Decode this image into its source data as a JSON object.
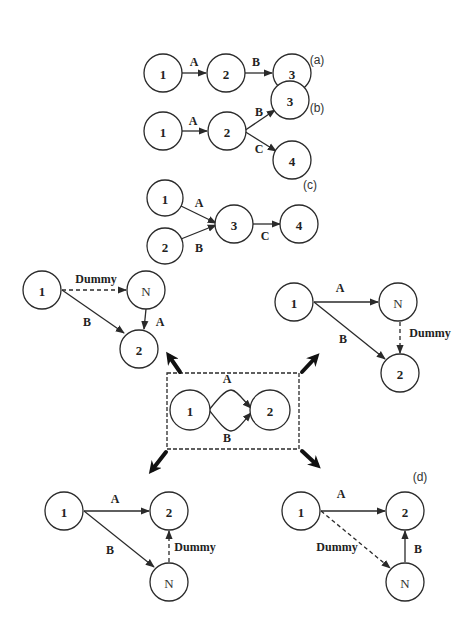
{
  "diagram": {
    "type": "activity-on-arrow network diagrams",
    "panels": [
      {
        "id": "a",
        "label": "(a)",
        "nodes": [
          {
            "id": "1",
            "label": "1",
            "x": 163,
            "y": 73
          },
          {
            "id": "2",
            "label": "2",
            "x": 226,
            "y": 73
          },
          {
            "id": "3",
            "label": "3",
            "x": 292,
            "y": 73
          }
        ],
        "edges": [
          {
            "from": "1",
            "to": "2",
            "label": "A",
            "style": "solid"
          },
          {
            "from": "2",
            "to": "3",
            "label": "B",
            "style": "solid"
          }
        ]
      },
      {
        "id": "b",
        "label": "(b)",
        "nodes": [
          {
            "id": "1",
            "label": "1",
            "x": 163,
            "y": 131
          },
          {
            "id": "2",
            "label": "2",
            "x": 227,
            "y": 131
          },
          {
            "id": "3",
            "label": "3",
            "x": 290,
            "y": 100
          },
          {
            "id": "4",
            "label": "4",
            "x": 292,
            "y": 160
          }
        ],
        "edges": [
          {
            "from": "1",
            "to": "2",
            "label": "A",
            "style": "solid"
          },
          {
            "from": "2",
            "to": "3",
            "label": "B",
            "style": "solid"
          },
          {
            "from": "2",
            "to": "4",
            "label": "C",
            "style": "solid"
          }
        ]
      },
      {
        "id": "c",
        "label": "(c)",
        "nodes": [
          {
            "id": "1",
            "label": "1",
            "x": 165,
            "y": 198
          },
          {
            "id": "2",
            "label": "2",
            "x": 165,
            "y": 246
          },
          {
            "id": "3",
            "label": "3",
            "x": 234,
            "y": 224
          },
          {
            "id": "4",
            "label": "4",
            "x": 299,
            "y": 224
          }
        ],
        "edges": [
          {
            "from": "1",
            "to": "3",
            "label": "A",
            "style": "solid"
          },
          {
            "from": "2",
            "to": "3",
            "label": "B",
            "style": "solid"
          },
          {
            "from": "3",
            "to": "4",
            "label": "C",
            "style": "solid"
          }
        ]
      },
      {
        "id": "d",
        "label": "(d)",
        "center": {
          "nodes": [
            {
              "id": "1",
              "label": "1",
              "x": 190,
              "y": 410
            },
            {
              "id": "2",
              "label": "2",
              "x": 270,
              "y": 410
            }
          ],
          "edges": [
            {
              "from": "1",
              "to": "2",
              "label": "A",
              "style": "curved-top"
            },
            {
              "from": "1",
              "to": "2",
              "label": "B",
              "style": "curved-bottom"
            }
          ]
        },
        "variants": [
          {
            "position": "top-left",
            "nodes": [
              {
                "id": "1",
                "label": "1"
              },
              {
                "id": "N",
                "label": "N"
              },
              {
                "id": "2",
                "label": "2"
              }
            ],
            "edges": [
              {
                "from": "1",
                "to": "N",
                "label": "Dummy",
                "style": "dashed"
              },
              {
                "from": "N",
                "to": "2",
                "label": "A",
                "style": "solid"
              },
              {
                "from": "1",
                "to": "2",
                "label": "B",
                "style": "solid"
              }
            ]
          },
          {
            "position": "top-right",
            "nodes": [
              {
                "id": "1",
                "label": "1"
              },
              {
                "id": "N",
                "label": "N"
              },
              {
                "id": "2",
                "label": "2"
              }
            ],
            "edges": [
              {
                "from": "1",
                "to": "N",
                "label": "A",
                "style": "solid"
              },
              {
                "from": "N",
                "to": "2",
                "label": "Dummy",
                "style": "dashed"
              },
              {
                "from": "1",
                "to": "2",
                "label": "B",
                "style": "solid"
              }
            ]
          },
          {
            "position": "bottom-left",
            "nodes": [
              {
                "id": "1",
                "label": "1"
              },
              {
                "id": "2",
                "label": "2"
              },
              {
                "id": "N",
                "label": "N"
              }
            ],
            "edges": [
              {
                "from": "1",
                "to": "2",
                "label": "A",
                "style": "solid"
              },
              {
                "from": "1",
                "to": "N",
                "label": "B",
                "style": "solid"
              },
              {
                "from": "N",
                "to": "2",
                "label": "Dummy",
                "style": "dashed"
              }
            ]
          },
          {
            "position": "bottom-right",
            "nodes": [
              {
                "id": "1",
                "label": "1"
              },
              {
                "id": "2",
                "label": "2"
              },
              {
                "id": "N",
                "label": "N"
              }
            ],
            "edges": [
              {
                "from": "1",
                "to": "2",
                "label": "A",
                "style": "solid"
              },
              {
                "from": "1",
                "to": "N",
                "label": "Dummy",
                "style": "dashed"
              },
              {
                "from": "N",
                "to": "2",
                "label": "B",
                "style": "solid"
              }
            ]
          }
        ]
      }
    ]
  },
  "labels": {
    "a": "(a)",
    "b": "(b)",
    "c": "(c)",
    "d": "(d)",
    "one": "1",
    "two": "2",
    "three": "3",
    "four": "4",
    "n": "N",
    "A": "A",
    "B": "B",
    "C": "C",
    "dummy": "Dummy"
  }
}
